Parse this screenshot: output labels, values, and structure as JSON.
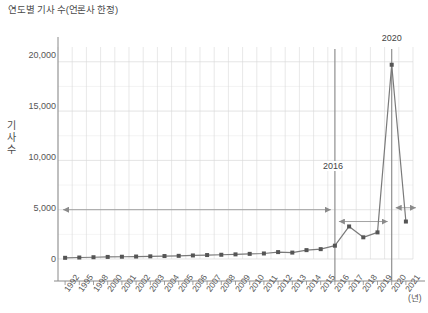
{
  "chart_data": {
    "type": "line",
    "title": "연도별 기사 수(언론사 한정)",
    "xlabel": "(년)",
    "ylabel": "기사 수",
    "ylabel_chars": [
      "기",
      "사",
      "수"
    ],
    "x_unit": "(년)",
    "categories": [
      "1992",
      "1995",
      "1998",
      "2000",
      "2001",
      "2002",
      "2003",
      "2004",
      "2005",
      "2006",
      "2007",
      "2008",
      "2009",
      "2010",
      "2011",
      "2012",
      "2013",
      "2014",
      "2015",
      "2016",
      "2017",
      "2018",
      "2019",
      "2020",
      "2021"
    ],
    "values": [
      120,
      150,
      180,
      210,
      230,
      250,
      270,
      300,
      320,
      360,
      400,
      430,
      470,
      520,
      560,
      700,
      650,
      900,
      1000,
      1350,
      3300,
      2200,
      2700,
      19700,
      3800
    ],
    "ytick_labels": [
      "0",
      "5,000",
      "10,000",
      "15,000",
      "20,000"
    ],
    "ytick_values": [
      0,
      5000,
      10000,
      15000,
      20000
    ],
    "ylim": [
      0,
      21500
    ],
    "grid": true,
    "legend": "none",
    "series_color": "#7a7a7a",
    "marker_color": "#555555",
    "grid_color": "#d9d9d9",
    "axis_color": "#999999",
    "annotations": [
      {
        "label": "2016",
        "x_category": "2016",
        "type": "vertical-marker-line"
      },
      {
        "label": "2020",
        "x_category": "2020",
        "type": "vertical-marker-line"
      }
    ],
    "span_arrows": [
      {
        "from": "1992",
        "to": "2016",
        "level": 5000,
        "style": "double-headed"
      },
      {
        "from": "2016",
        "to": "2020",
        "level": 3800,
        "style": "double-headed"
      },
      {
        "from": "2020",
        "to": "2021",
        "level": 5200,
        "style": "double-headed"
      }
    ]
  }
}
